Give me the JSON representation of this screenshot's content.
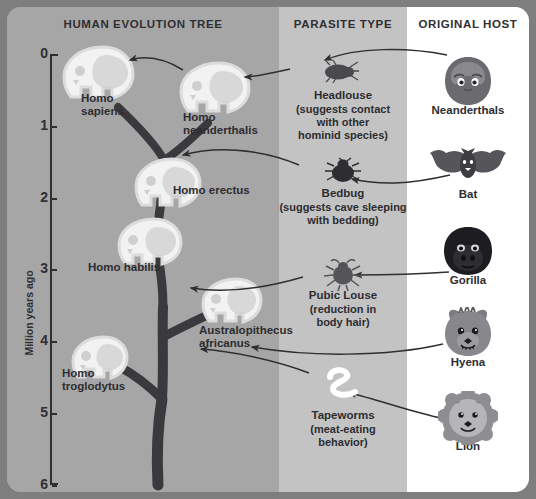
{
  "columns": {
    "tree_header": "HUMAN EVOLUTION TREE",
    "parasite_header": "PARASITE TYPE",
    "host_header": "ORIGINAL HOST"
  },
  "axis": {
    "title": "Million years ago",
    "ticks": [
      "0",
      "1",
      "2",
      "3",
      "4",
      "5",
      "6"
    ],
    "min": 0,
    "max": 6
  },
  "species": [
    {
      "name": "Homo\nsapiens",
      "line1": "Homo",
      "line2": "sapiens",
      "mya": 0.25
    },
    {
      "name": "Homo\nneanderthalis",
      "line1": "Homo",
      "line2": "neanderthalis",
      "mya": 0.5
    },
    {
      "name": "Homo erectus",
      "line1": "Homo erectus",
      "line2": "",
      "mya": 1.6
    },
    {
      "name": "Homo habilis",
      "line1": "Homo habilis",
      "line2": "",
      "mya": 2.6
    },
    {
      "name": "Australopithecus\nafricanus",
      "line1": "Australopithecus",
      "line2": "africanus",
      "mya": 3.3
    },
    {
      "name": "Homo\ntroglodytus",
      "line1": "Homo",
      "line2": "troglodytus",
      "mya": 4.3
    }
  ],
  "parasites": [
    {
      "icon": "headlouse-icon",
      "name": "Headlouse",
      "note": "(suggests contact\nwith other\nhominid species)",
      "note_lines": [
        "(suggests contact",
        "with other",
        "hominid species)"
      ]
    },
    {
      "icon": "bedbug-icon",
      "name": "Bedbug",
      "note": "(suggests cave sleeping\nwith bedding)",
      "note_lines": [
        "(suggests cave sleeping",
        "with bedding)"
      ]
    },
    {
      "icon": "pubic-louse-icon",
      "name": "Pubic Louse",
      "note": "(reduction in\nbody hair)",
      "note_lines": [
        "(reduction in",
        "body hair)"
      ]
    },
    {
      "icon": "tapeworm-icon",
      "name": "Tapeworms",
      "note": "(meat-eating\nbehavior)",
      "note_lines": [
        "(meat-eating",
        "behavior)"
      ]
    }
  ],
  "hosts": [
    {
      "icon": "neanderthal-face-icon",
      "name": "Neanderthals"
    },
    {
      "icon": "bat-icon",
      "name": "Bat"
    },
    {
      "icon": "gorilla-icon",
      "name": "Gorilla"
    },
    {
      "icon": "hyena-icon",
      "name": "Hyena"
    },
    {
      "icon": "lion-icon",
      "name": "Lion"
    }
  ],
  "colors": {
    "tree_bg": "#a6a6a6",
    "parasite_bg": "#c3c3c3",
    "host_bg": "#ffffff",
    "frame": "#7e7e7f",
    "ink": "#2d2d31",
    "branch": "#3a3a3e",
    "skull": "#f2f2f2"
  }
}
